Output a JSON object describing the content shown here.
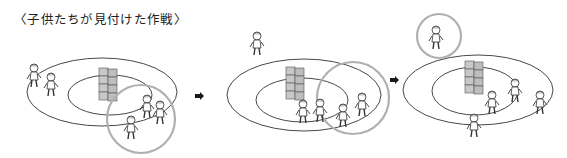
{
  "caption": "〈子供たちが見付けた作戦〉",
  "colors": {
    "line": "#333333",
    "highlight_circle": "#b0b0b0",
    "block_fill": "#c8c8c8",
    "arrow": "#1a1a1a"
  },
  "panels": [
    {
      "label": "panel-1",
      "description": "three children grouped at lower-right of field, highlighted by circle"
    },
    {
      "label": "panel-2",
      "description": "children move to right side of field, highlighted by circle"
    },
    {
      "label": "panel-3",
      "description": "one child breaks free at top-left, highlighted by circle"
    }
  ],
  "arrows": [
    "arrow-right",
    "arrow-right"
  ]
}
